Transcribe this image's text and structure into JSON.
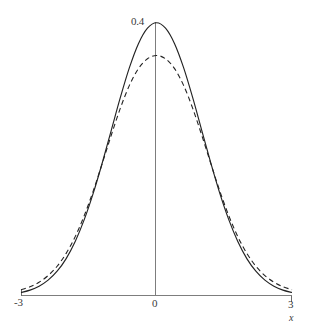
{
  "chart_data": {
    "type": "line",
    "title": "",
    "subtitle": "",
    "xlabel": "x",
    "ylabel": "",
    "xlim": [
      -3,
      3
    ],
    "ylim": [
      0,
      0.4
    ],
    "grid": false,
    "legend": "none",
    "x_ticks": [
      {
        "value": -3,
        "label": "-3"
      },
      {
        "value": 0,
        "label": "0"
      },
      {
        "value": 3,
        "label": "3"
      }
    ],
    "y_ticks": [
      {
        "value": 0.4,
        "label": "0.4"
      }
    ],
    "annotations": [
      {
        "text": "0.4",
        "x": 0,
        "y": 0.4,
        "placement": "above-left-of-peak"
      },
      {
        "text": "x",
        "x": 3,
        "y": 0,
        "placement": "below-right-axis-end",
        "style": "italic"
      }
    ],
    "series": [
      {
        "name": "solid-curve",
        "style": "solid",
        "color": "#232323",
        "peak_value": 0.399,
        "x": [
          -3.0,
          -2.8,
          -2.6,
          -2.4,
          -2.2,
          -2.0,
          -1.8,
          -1.6,
          -1.4,
          -1.2,
          -1.0,
          -0.8,
          -0.6,
          -0.4,
          -0.2,
          0.0,
          0.2,
          0.4,
          0.6,
          0.8,
          1.0,
          1.2,
          1.4,
          1.6,
          1.8,
          2.0,
          2.2,
          2.4,
          2.6,
          2.8,
          3.0
        ],
        "values": [
          0.0044,
          0.0079,
          0.0136,
          0.0224,
          0.0355,
          0.054,
          0.079,
          0.1109,
          0.1497,
          0.1942,
          0.242,
          0.2897,
          0.3332,
          0.3683,
          0.391,
          0.3989,
          0.391,
          0.3683,
          0.3332,
          0.2897,
          0.242,
          0.1942,
          0.1497,
          0.1109,
          0.079,
          0.054,
          0.0355,
          0.0224,
          0.0136,
          0.0079,
          0.0044
        ]
      },
      {
        "name": "dashed-curve",
        "style": "dashed",
        "color": "#232323",
        "peak_value": 0.362,
        "x": [
          -3.0,
          -2.8,
          -2.6,
          -2.4,
          -2.2,
          -2.0,
          -1.8,
          -1.6,
          -1.4,
          -1.2,
          -1.0,
          -0.8,
          -0.6,
          -0.4,
          -0.2,
          0.0,
          0.2,
          0.4,
          0.6,
          0.8,
          1.0,
          1.2,
          1.4,
          1.6,
          1.8,
          2.0,
          2.2,
          2.4,
          2.6,
          2.8,
          3.0
        ],
        "values": [
          0.0085,
          0.0128,
          0.0194,
          0.0291,
          0.0428,
          0.0616,
          0.0861,
          0.1168,
          0.1531,
          0.1934,
          0.2348,
          0.274,
          0.3073,
          0.3318,
          0.3462,
          0.351,
          0.3462,
          0.3318,
          0.3073,
          0.274,
          0.2348,
          0.1934,
          0.1531,
          0.1168,
          0.0861,
          0.0616,
          0.0428,
          0.0291,
          0.0194,
          0.0128,
          0.0085
        ]
      }
    ]
  },
  "figure": {
    "caption": "",
    "background_color": "#ffffff",
    "axis_color": "#7d7d7d",
    "curve_color": "#232323"
  }
}
